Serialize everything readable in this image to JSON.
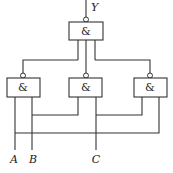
{
  "diagram": {
    "type": "logic-circuit",
    "output_label": "Y",
    "input_labels": [
      "A",
      "B",
      "C"
    ],
    "gates": [
      {
        "id": "top",
        "symbol": "&",
        "type": "NAND"
      },
      {
        "id": "left",
        "symbol": "&",
        "type": "NAND"
      },
      {
        "id": "middle",
        "symbol": "&",
        "type": "NAND"
      },
      {
        "id": "right",
        "symbol": "&",
        "type": "NAND"
      }
    ],
    "connections": [
      "left gate inputs: A, B",
      "middle gate inputs: B, C",
      "right gate inputs: C, A",
      "top gate inputs: left, middle, right outputs",
      "top gate output: Y"
    ]
  }
}
